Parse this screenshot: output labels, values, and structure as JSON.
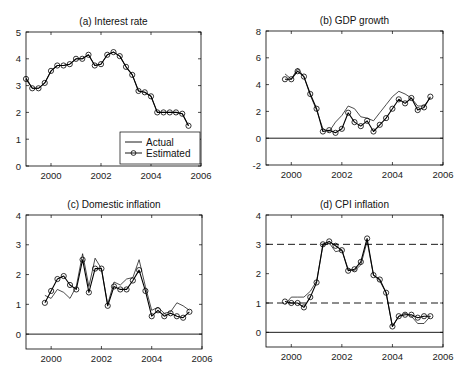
{
  "chart_data": [
    {
      "type": "line",
      "title": "(a) Interest rate",
      "xlabel": "",
      "ylabel": "",
      "xlim": [
        1999,
        2006
      ],
      "ylim": [
        0,
        5
      ],
      "xticks": [
        2000,
        2002,
        2004,
        2006
      ],
      "yticks": [
        0,
        1,
        2,
        3,
        4,
        5
      ],
      "grid": false,
      "legend": {
        "position": "bottom-right",
        "entries": [
          "Actual",
          "Estimated"
        ]
      },
      "hlines": [],
      "series": [
        {
          "name": "Actual",
          "marker": "none",
          "x": [
            1999.0,
            1999.25,
            1999.5,
            1999.75,
            2000.0,
            2000.25,
            2000.5,
            2000.75,
            2001.0,
            2001.25,
            2001.5,
            2001.75,
            2002.0,
            2002.25,
            2002.5,
            2002.75,
            2003.0,
            2003.25,
            2003.5,
            2003.75,
            2004.0,
            2004.25,
            2004.5,
            2004.75,
            2005.0,
            2005.25,
            2005.5
          ],
          "y": [
            3.3,
            2.9,
            2.9,
            3.1,
            3.55,
            3.75,
            3.75,
            3.8,
            4.0,
            4.0,
            4.15,
            3.75,
            3.8,
            4.15,
            4.25,
            4.1,
            3.7,
            3.4,
            2.8,
            2.75,
            2.6,
            2.0,
            2.0,
            2.0,
            2.0,
            1.95,
            1.5
          ]
        },
        {
          "name": "Estimated",
          "marker": "circle",
          "x": [
            1999.0,
            1999.25,
            1999.5,
            1999.75,
            2000.0,
            2000.25,
            2000.5,
            2000.75,
            2001.0,
            2001.25,
            2001.5,
            2001.75,
            2002.0,
            2002.25,
            2002.5,
            2002.75,
            2003.0,
            2003.25,
            2003.5,
            2003.75,
            2004.0,
            2004.25,
            2004.5,
            2004.75,
            2005.0,
            2005.25,
            2005.5
          ],
          "y": [
            3.25,
            2.9,
            2.9,
            3.1,
            3.55,
            3.75,
            3.75,
            3.8,
            4.0,
            4.0,
            4.15,
            3.75,
            3.8,
            4.15,
            4.25,
            4.1,
            3.7,
            3.4,
            2.8,
            2.75,
            2.6,
            2.0,
            2.0,
            2.0,
            2.0,
            1.95,
            1.5
          ]
        }
      ]
    },
    {
      "type": "line",
      "title": "(b) GDP growth",
      "xlabel": "",
      "ylabel": "",
      "xlim": [
        1999,
        2006
      ],
      "ylim": [
        -2,
        8
      ],
      "xticks": [
        2000,
        2002,
        2004,
        2006
      ],
      "yticks": [
        -2,
        0,
        2,
        4,
        6,
        8
      ],
      "grid": false,
      "hlines": [
        {
          "y": 0,
          "style": "solid"
        }
      ],
      "series": [
        {
          "name": "Actual",
          "marker": "none",
          "x": [
            1999.75,
            2000.0,
            2000.25,
            2000.5,
            2000.75,
            2001.0,
            2001.25,
            2001.5,
            2001.75,
            2002.0,
            2002.25,
            2002.5,
            2002.75,
            2003.0,
            2003.25,
            2003.5,
            2003.75,
            2004.0,
            2004.25,
            2004.5,
            2004.75,
            2005.0,
            2005.25,
            2005.5
          ],
          "y": [
            4.8,
            4.4,
            5.2,
            4.6,
            3.2,
            2.1,
            0.7,
            0.5,
            1.2,
            1.7,
            2.4,
            2.2,
            1.6,
            1.5,
            1.3,
            1.9,
            2.5,
            3.1,
            3.5,
            3.3,
            3.0,
            2.4,
            2.4,
            3.0
          ]
        },
        {
          "name": "Estimated",
          "marker": "circle",
          "x": [
            1999.75,
            2000.0,
            2000.25,
            2000.5,
            2000.75,
            2001.0,
            2001.25,
            2001.5,
            2001.75,
            2002.0,
            2002.25,
            2002.5,
            2002.75,
            2003.0,
            2003.25,
            2003.5,
            2003.75,
            2004.0,
            2004.25,
            2004.5,
            2004.75,
            2005.0,
            2005.25,
            2005.5
          ],
          "y": [
            4.4,
            4.4,
            5.0,
            4.6,
            3.3,
            2.2,
            0.5,
            0.6,
            0.4,
            0.7,
            1.9,
            1.2,
            0.9,
            1.3,
            0.5,
            1.0,
            1.5,
            2.2,
            2.9,
            2.6,
            3.0,
            2.1,
            2.3,
            3.1
          ]
        }
      ]
    },
    {
      "type": "line",
      "title": "(c) Domestic inflation",
      "xlabel": "",
      "ylabel": "",
      "xlim": [
        1999,
        2006
      ],
      "ylim": [
        -0.5,
        4
      ],
      "xticks": [
        2000,
        2002,
        2004,
        2006
      ],
      "yticks": [
        0,
        1,
        2,
        3,
        4
      ],
      "grid": false,
      "hlines": [
        {
          "y": 0,
          "style": "solid"
        }
      ],
      "series": [
        {
          "name": "Actual",
          "marker": "none",
          "x": [
            1999.75,
            2000.0,
            2000.25,
            2000.5,
            2000.75,
            2001.0,
            2001.25,
            2001.5,
            2001.75,
            2002.0,
            2002.25,
            2002.5,
            2002.75,
            2003.0,
            2003.25,
            2003.5,
            2003.75,
            2004.0,
            2004.25,
            2004.5,
            2004.75,
            2005.0,
            2005.25,
            2005.5
          ],
          "y": [
            1.3,
            1.2,
            1.5,
            1.4,
            1.2,
            1.6,
            2.7,
            1.6,
            2.55,
            2.2,
            1.0,
            1.75,
            1.65,
            1.85,
            1.9,
            2.5,
            1.6,
            0.8,
            0.9,
            0.7,
            0.75,
            1.05,
            0.95,
            0.8
          ]
        },
        {
          "name": "Estimated",
          "marker": "circle",
          "x": [
            1999.75,
            2000.0,
            2000.25,
            2000.5,
            2000.75,
            2001.0,
            2001.25,
            2001.5,
            2001.75,
            2002.0,
            2002.25,
            2002.5,
            2002.75,
            2003.0,
            2003.25,
            2003.5,
            2003.75,
            2004.0,
            2004.25,
            2004.5,
            2004.75,
            2005.0,
            2005.25,
            2005.5
          ],
          "y": [
            1.05,
            1.45,
            1.85,
            1.95,
            1.65,
            1.5,
            2.5,
            1.4,
            2.2,
            2.2,
            0.95,
            1.6,
            1.5,
            1.5,
            1.8,
            2.15,
            1.45,
            0.6,
            0.8,
            0.6,
            0.7,
            0.6,
            0.55,
            0.75
          ]
        }
      ]
    },
    {
      "type": "line",
      "title": "(d) CPI inflation",
      "xlabel": "",
      "ylabel": "",
      "xlim": [
        1999,
        2006
      ],
      "ylim": [
        -0.5,
        4
      ],
      "xticks": [
        2000,
        2002,
        2004,
        2006
      ],
      "yticks": [
        0,
        1,
        2,
        3,
        4
      ],
      "grid": false,
      "hlines": [
        {
          "y": 0,
          "style": "solid"
        },
        {
          "y": 1,
          "style": "dashed"
        },
        {
          "y": 3,
          "style": "dashed"
        }
      ],
      "series": [
        {
          "name": "Actual",
          "marker": "none",
          "x": [
            1999.75,
            2000.0,
            2000.25,
            2000.5,
            2000.75,
            2001.0,
            2001.25,
            2001.5,
            2001.75,
            2002.0,
            2002.25,
            2002.5,
            2002.75,
            2003.0,
            2003.25,
            2003.5,
            2003.75,
            2004.0,
            2004.25,
            2004.5,
            2004.75,
            2005.0,
            2005.25,
            2005.5
          ],
          "y": [
            0.95,
            1.2,
            1.2,
            1.2,
            1.4,
            1.75,
            2.95,
            3.05,
            2.75,
            2.8,
            2.15,
            2.1,
            2.3,
            3.1,
            1.95,
            1.75,
            1.35,
            0.2,
            0.55,
            0.65,
            0.55,
            0.3,
            0.3,
            0.55
          ]
        },
        {
          "name": "Estimated",
          "marker": "circle",
          "x": [
            1999.75,
            2000.0,
            2000.25,
            2000.5,
            2000.75,
            2001.0,
            2001.25,
            2001.5,
            2001.75,
            2002.0,
            2002.25,
            2002.5,
            2002.75,
            2003.0,
            2003.25,
            2003.5,
            2003.75,
            2004.0,
            2004.25,
            2004.5,
            2004.75,
            2005.0,
            2005.25,
            2005.5
          ],
          "y": [
            1.05,
            1.0,
            1.0,
            0.85,
            1.2,
            1.7,
            3.0,
            3.1,
            2.95,
            2.8,
            2.1,
            2.15,
            2.4,
            3.2,
            1.95,
            1.8,
            1.35,
            0.2,
            0.55,
            0.6,
            0.6,
            0.5,
            0.55,
            0.55
          ]
        }
      ]
    }
  ]
}
